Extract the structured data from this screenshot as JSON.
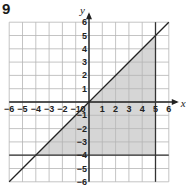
{
  "question_number": "9",
  "chart_data": {
    "type": "line",
    "title": "",
    "xlabel": "x",
    "ylabel": "y",
    "xlim": [
      -6,
      6
    ],
    "ylim": [
      -6,
      6
    ],
    "grid": true,
    "x_ticks": [
      -6,
      -5,
      -4,
      -3,
      -2,
      -1,
      0,
      1,
      2,
      3,
      4,
      5,
      6
    ],
    "y_ticks": [
      -6,
      -5,
      -4,
      -3,
      -2,
      -1,
      1,
      2,
      3,
      4,
      5,
      6
    ],
    "lines": [
      {
        "name": "y = x",
        "type": "diagonal",
        "from": [
          -6,
          -6
        ],
        "to": [
          6,
          6
        ]
      },
      {
        "name": "x = 5",
        "type": "vertical",
        "x": 5
      },
      {
        "name": "y = -4",
        "type": "horizontal",
        "y": -4
      }
    ],
    "shaded_region": {
      "description": "Triangle bounded by y = x, x = 5 and y = -4",
      "vertices": [
        [
          -4,
          -4
        ],
        [
          5,
          5
        ],
        [
          5,
          -4
        ]
      ],
      "color": "#d6d6d6"
    }
  }
}
